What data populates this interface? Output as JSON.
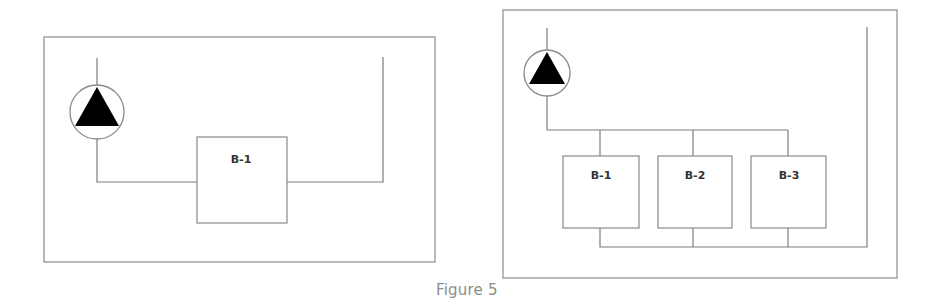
{
  "figure": {
    "caption": "Figure 5",
    "colors": {
      "line": "#7c7c7c",
      "pump_fill": "#000000",
      "caption": "#8d8d8d"
    }
  },
  "panels": [
    {
      "name": "single-boiler-loop",
      "boxes": [
        {
          "label": "B-1"
        }
      ],
      "icons": [
        "pump-icon"
      ]
    },
    {
      "name": "parallel-boiler-loop",
      "boxes": [
        {
          "label": "B-1"
        },
        {
          "label": "B-2"
        },
        {
          "label": "B-3"
        }
      ],
      "icons": [
        "pump-icon"
      ]
    }
  ]
}
